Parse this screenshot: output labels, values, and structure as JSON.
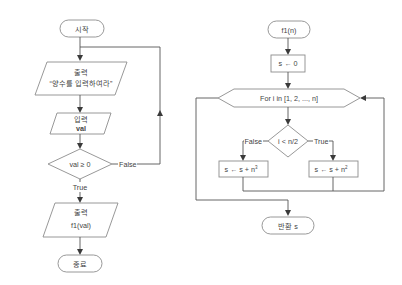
{
  "left_flowchart": {
    "start": "시작",
    "output1": {
      "title": "출력",
      "value": "“양수를 입력하여라”"
    },
    "input1": {
      "title": "입력",
      "value": "val"
    },
    "decision": {
      "condition": "val ≥ 0",
      "true_label": "True",
      "false_label": "False"
    },
    "output2": {
      "title": "출력",
      "value": "f1(val)"
    },
    "end": "종료"
  },
  "right_flowchart": {
    "start": "f1(n)",
    "init": "s ← 0",
    "loop": "For i in [1, 2, ..., n]",
    "decision": {
      "condition": "i < n/2",
      "true_label": "True",
      "false_label": "False"
    },
    "false_branch": {
      "base": "s ← s + n",
      "exp": "3"
    },
    "true_branch": {
      "base": "s ← s + n",
      "exp": "2"
    },
    "return": "반환 s"
  },
  "colors": {
    "stroke": "#8c8c8c",
    "line": "#555555",
    "text": "#444444",
    "background": "#ffffff"
  }
}
